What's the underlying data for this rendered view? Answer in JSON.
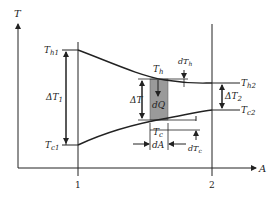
{
  "diagram": {
    "type": "heat-exchanger-temperature-profile",
    "axes": {
      "y_label": "T",
      "x_label": "A",
      "x_ticks": [
        "1",
        "2"
      ]
    },
    "labels": {
      "th1": "T",
      "th1_sub": "h1",
      "tc1": "T",
      "tc1_sub": "c1",
      "th2": "T",
      "th2_sub": "h2",
      "tc2": "T",
      "tc2_sub": "c2",
      "dT1": "ΔT",
      "dT1_sub": "1",
      "dT2": "ΔT",
      "dT2_sub": "2",
      "dT": "ΔT",
      "th": "T",
      "th_sub": "h",
      "tc": "T",
      "tc_sub": "c",
      "dth": "dT",
      "dth_sub": "h",
      "dtc": "dT",
      "dtc_sub": "c",
      "dQ": "dQ",
      "dA": "dA"
    },
    "colors": {
      "line": "#222222",
      "element_fill": "#9a9a9a"
    }
  }
}
